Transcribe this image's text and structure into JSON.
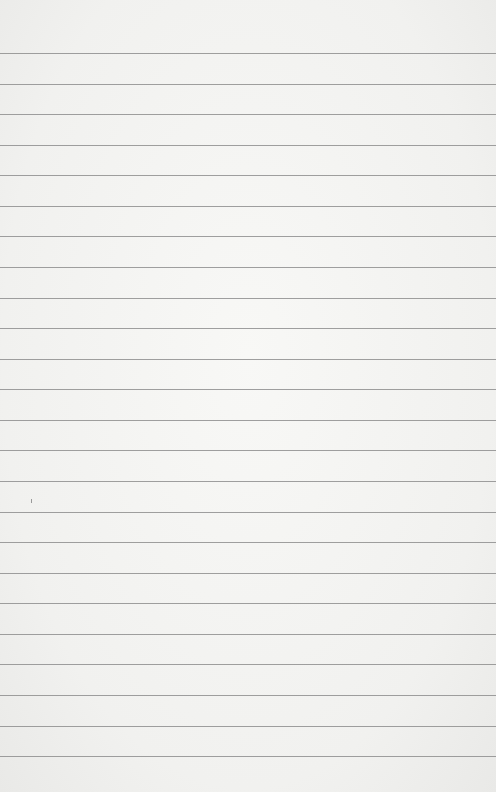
{
  "image": {
    "subject": "blank lined paper",
    "line_count": 24,
    "first_line_y": 53,
    "line_spacing": 30.57,
    "line_color": "#8e8e8e",
    "paper_color": "#f4f4f2"
  }
}
